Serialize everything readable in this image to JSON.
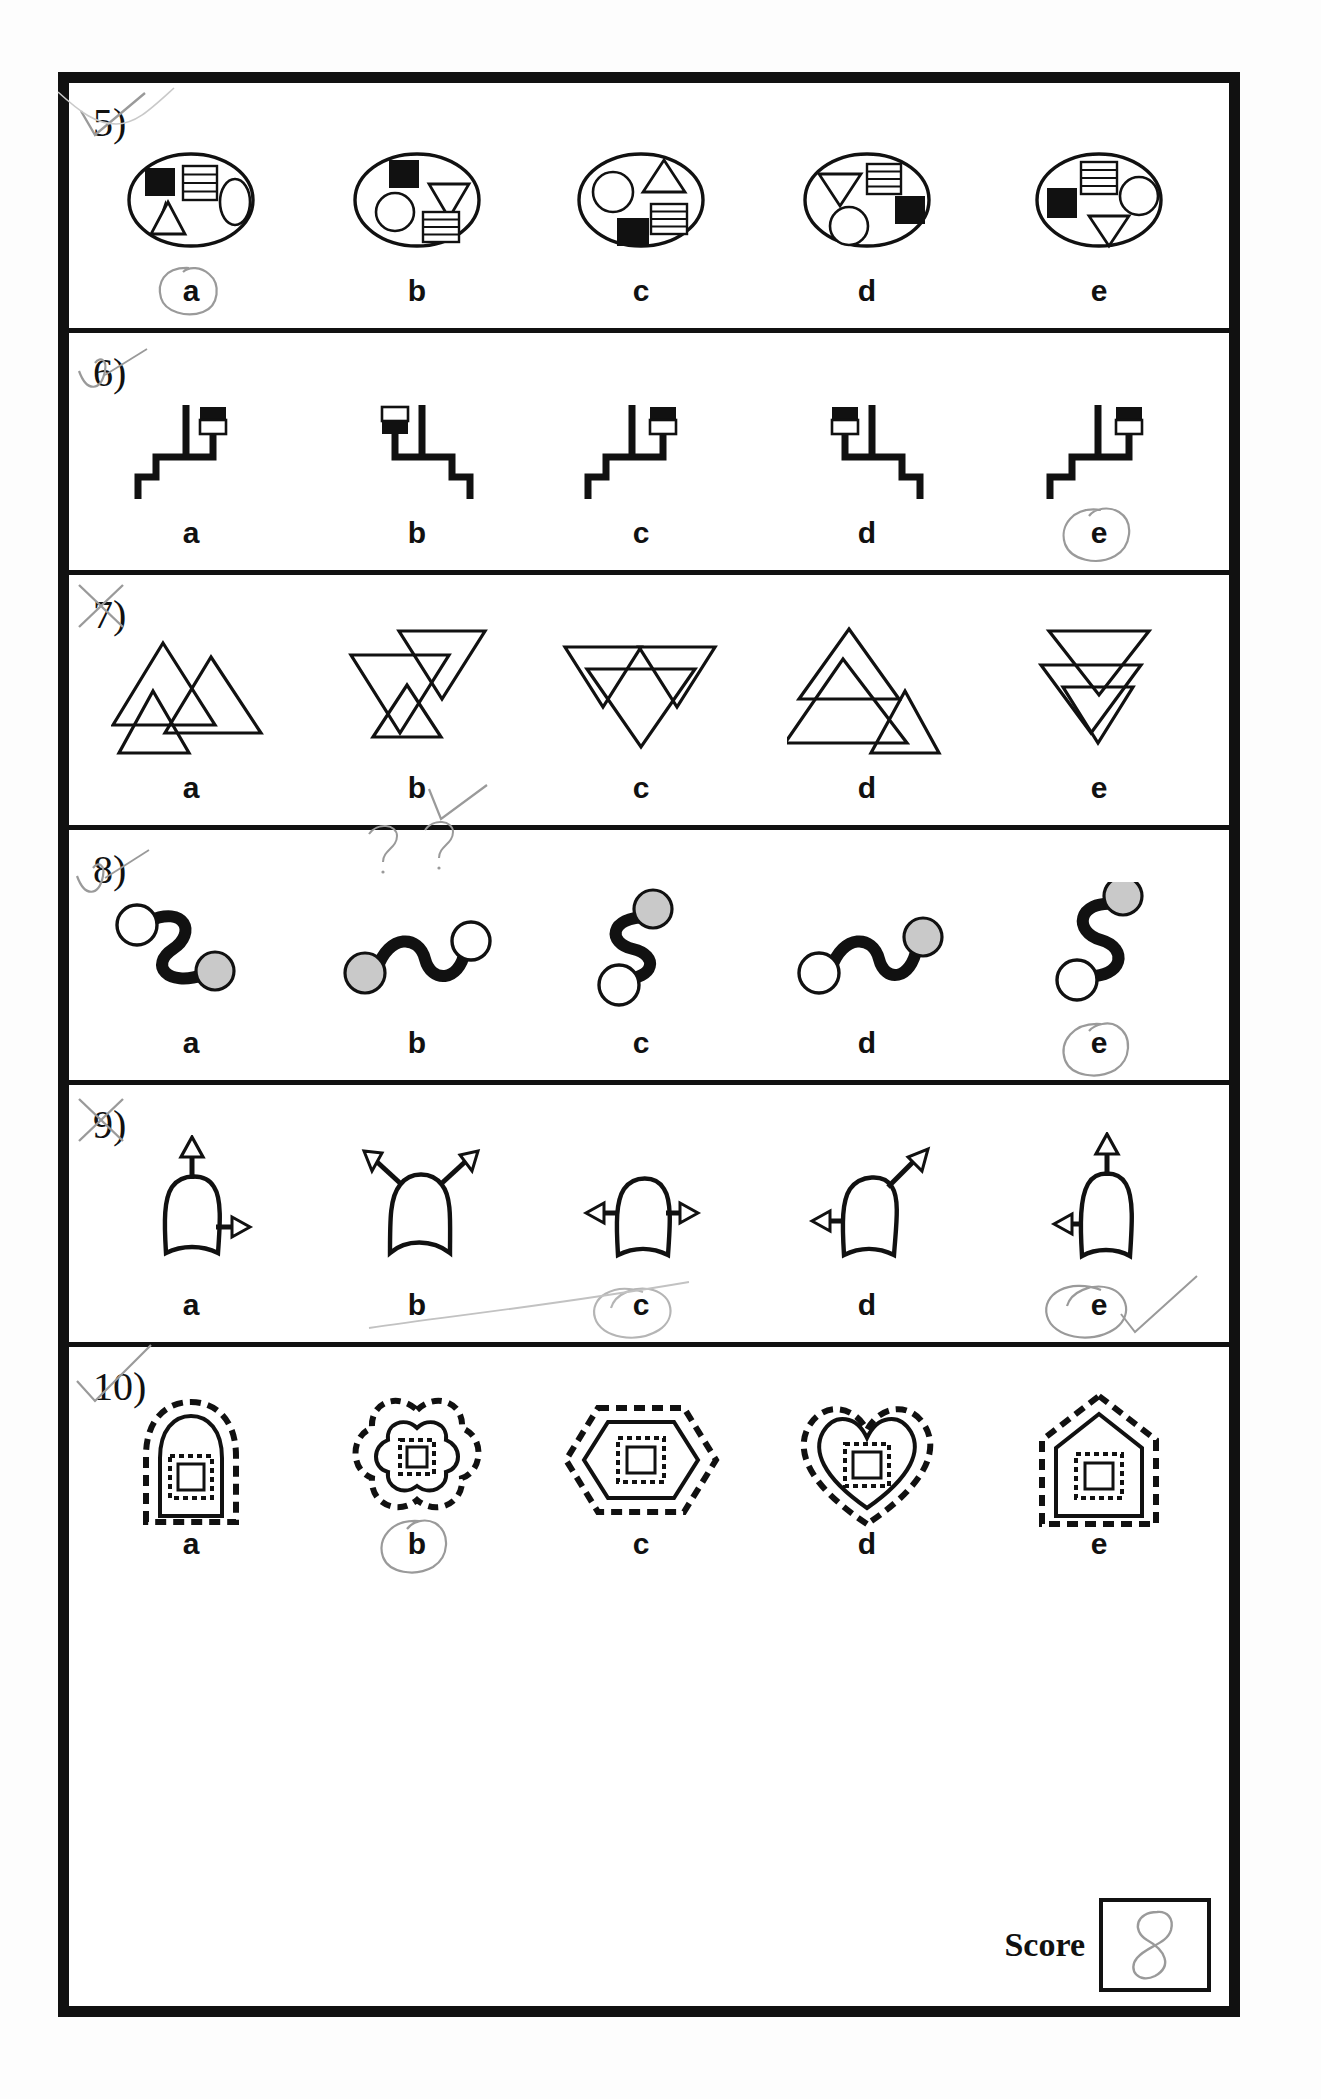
{
  "worksheet": {
    "type": "visual-discrimination-test",
    "score_label": "Score",
    "score_value": "8",
    "option_letters": [
      "a",
      "b",
      "c",
      "d",
      "e"
    ]
  },
  "questions": [
    {
      "number": "5)",
      "stimulus_type": "ellipse-with-four-shapes",
      "marked_answer": "a",
      "teacher_mark": "check",
      "options": [
        {
          "letter": "a",
          "shapes": [
            "black-square",
            "striped-rect",
            "small-ellipse",
            "triangle-up"
          ]
        },
        {
          "letter": "b",
          "shapes": [
            "black-square",
            "triangle-down",
            "circle",
            "striped-rect"
          ]
        },
        {
          "letter": "c",
          "shapes": [
            "circle",
            "triangle-up",
            "striped-rect",
            "black-square"
          ]
        },
        {
          "letter": "d",
          "shapes": [
            "triangle-down",
            "striped-rect",
            "black-square",
            "circle"
          ]
        },
        {
          "letter": "e",
          "shapes": [
            "striped-rect",
            "black-square",
            "circle",
            "triangle-down"
          ]
        }
      ]
    },
    {
      "number": "6)",
      "stimulus_type": "stepped-line-with-flag",
      "marked_answer": "e",
      "teacher_mark": "check",
      "options": [
        {
          "letter": "a",
          "flag": "top-black-bottom-white",
          "stem": "left"
        },
        {
          "letter": "b",
          "flag": "top-white-bottom-black",
          "stem": "right"
        },
        {
          "letter": "c",
          "flag": "top-black-bottom-white",
          "stem": "left"
        },
        {
          "letter": "d",
          "flag": "top-black-bottom-white",
          "stem": "right"
        },
        {
          "letter": "e",
          "flag": "top-black-bottom-white",
          "stem": "left"
        }
      ]
    },
    {
      "number": "7)",
      "stimulus_type": "overlapping-triangles",
      "marked_answer": "b",
      "teacher_mark": "cross",
      "options": [
        {
          "letter": "a",
          "config": "two-up-one-small-up"
        },
        {
          "letter": "b",
          "config": "down-down-up-stacked"
        },
        {
          "letter": "c",
          "config": "three-down-overlap"
        },
        {
          "letter": "d",
          "config": "up-up-up-cascade"
        },
        {
          "letter": "e",
          "config": "down-down-stacked"
        }
      ]
    },
    {
      "number": "8)",
      "stimulus_type": "s-curve-with-end-circles",
      "marked_answer": "e",
      "teacher_mark": "check",
      "annotation": "??",
      "options": [
        {
          "letter": "a",
          "start_circle": "white",
          "end_circle": "grey",
          "orientation": "horizontal-s"
        },
        {
          "letter": "b",
          "start_circle": "grey",
          "end_circle": "white",
          "orientation": "horizontal-s"
        },
        {
          "letter": "c",
          "start_circle": "grey",
          "end_circle": "white",
          "orientation": "vertical-s"
        },
        {
          "letter": "d",
          "start_circle": "white",
          "end_circle": "grey",
          "orientation": "horizontal-s"
        },
        {
          "letter": "e",
          "start_circle": "grey",
          "end_circle": "white",
          "orientation": "vertical-s"
        }
      ]
    },
    {
      "number": "9)",
      "stimulus_type": "dome-shape-with-arrows",
      "marked_answer": "e",
      "teacher_mark": "cross",
      "extra_marks": [
        "circle-around-c",
        "circle-around-e",
        "check"
      ],
      "options": [
        {
          "letter": "a",
          "arrows": [
            "up",
            "right"
          ]
        },
        {
          "letter": "b",
          "arrows": [
            "up-left",
            "up-right"
          ]
        },
        {
          "letter": "c",
          "arrows": [
            "left",
            "right"
          ]
        },
        {
          "letter": "d",
          "arrows": [
            "left",
            "up-right-diagonal"
          ]
        },
        {
          "letter": "e",
          "arrows": [
            "up",
            "left"
          ]
        }
      ]
    },
    {
      "number": "10)",
      "stimulus_type": "nested-dashed-outline-shapes",
      "marked_answer": "b",
      "teacher_mark": "check",
      "options": [
        {
          "letter": "a",
          "outer": "arch",
          "inner": "square"
        },
        {
          "letter": "b",
          "outer": "cloverleaf",
          "inner": "square"
        },
        {
          "letter": "c",
          "outer": "hexagon",
          "inner": "square"
        },
        {
          "letter": "d",
          "outer": "heart",
          "inner": "square"
        },
        {
          "letter": "e",
          "outer": "house",
          "inner": "square"
        }
      ]
    }
  ],
  "colors": {
    "ink": "#111111",
    "pencil": "#9a9a9a",
    "grey_fill": "#c9c9c9",
    "paper": "#ffffff"
  }
}
